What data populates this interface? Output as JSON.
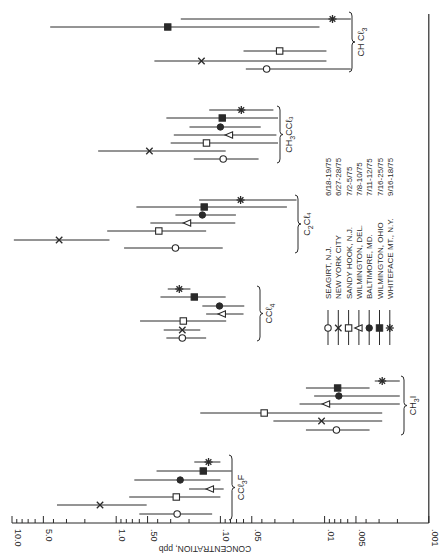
{
  "chart_data": {
    "type": "scatter",
    "orientation": "horizontal-log-x, rotated page",
    "title": "",
    "xlabel": "CONCENTRATION, ppb",
    "ylabel": "",
    "xscale": "log",
    "xlim": [
      0.001,
      10.0
    ],
    "tick_labels": [
      "10.0",
      "5.0",
      "1.0",
      ".50",
      ".10",
      ".05",
      ".01",
      ".005",
      ".001"
    ],
    "tick_values": [
      10.0,
      5.0,
      1.0,
      0.5,
      0.1,
      0.05,
      0.01,
      0.005,
      0.001
    ],
    "grid": false,
    "legend_position": "inside, center-right",
    "legend": [
      {
        "marker": "open-circle",
        "site": "SEAGIRT, N.J.",
        "dates": "6/18-19/75"
      },
      {
        "marker": "x",
        "site": "NEW YORK CITY",
        "dates": "6/27-28/75"
      },
      {
        "marker": "open-square",
        "site": "SANDY HOOK, N.J.",
        "dates": "7/2-5/75"
      },
      {
        "marker": "open-triangle-left",
        "site": "WILMINGTON, DEL.",
        "dates": "7/8-10/75"
      },
      {
        "marker": "filled-circle",
        "site": "BALTIMORE, MD.",
        "dates": "7/11-12/75"
      },
      {
        "marker": "filled-square",
        "site": "WILMINGTON, OHIO",
        "dates": "7/16-25/75"
      },
      {
        "marker": "asterisk",
        "site": "WHITEFACE MT., N.Y.",
        "dates": "9/16-18/75"
      }
    ],
    "groups": [
      {
        "compound": "CCl3F",
        "label_main": "CCℓ",
        "label_sub": "3",
        "label_tail": "F",
        "points": [
          {
            "series": "WHITEFACE MT., N.Y.",
            "marker": "asterisk",
            "value": 0.13,
            "low": 0.1,
            "high": 0.178,
            "y": 462
          },
          {
            "series": "WILMINGTON, OHIO",
            "marker": "filled-square",
            "value": 0.146,
            "low": 0.078,
            "high": 0.41,
            "y": 471
          },
          {
            "series": "BALTIMORE, MD.",
            "marker": "filled-circle",
            "value": 0.243,
            "low": 0.1,
            "high": 0.67,
            "y": 480
          },
          {
            "series": "WILMINGTON, DEL.",
            "marker": "open-triangle-left",
            "value": 0.125,
            "low": 0.093,
            "high": 0.2,
            "y": 489
          },
          {
            "series": "SANDY HOOK, N.J.",
            "marker": "open-square",
            "value": 0.265,
            "low": 0.1,
            "high": 0.75,
            "y": 497
          },
          {
            "series": "NEW YORK CITY",
            "marker": "x",
            "value": 1.43,
            "low": 0.51,
            "high": 3.7,
            "y": 505
          },
          {
            "series": "SEAGIRT, N.J.",
            "marker": "open-circle",
            "value": 0.26,
            "low": 0.12,
            "high": 0.6,
            "y": 514
          }
        ],
        "bracket": {
          "y1": 455,
          "y2": 520,
          "x": 232
        }
      },
      {
        "compound": "CH3I",
        "label_main": "CH",
        "label_sub": "3",
        "label_tail": "I",
        "points": [
          {
            "series": "WHITEFACE MT., N.Y.",
            "marker": "asterisk",
            "value": 0.0028,
            "low": 0.0019,
            "high": 0.0033,
            "y": 381
          },
          {
            "series": "WILMINGTON, OHIO",
            "marker": "filled-square",
            "value": 0.0075,
            "low": 0.0037,
            "high": 0.0151,
            "y": 388
          },
          {
            "series": "BALTIMORE, MD.",
            "marker": "filled-circle",
            "value": 0.0073,
            "low": 0.0019,
            "high": 0.0126,
            "y": 396
          },
          {
            "series": "WILMINGTON, DEL.",
            "marker": "open-triangle-left",
            "value": 0.0096,
            "low": 0.0019,
            "high": 0.0174,
            "y": 404
          },
          {
            "series": "SANDY HOOK, N.J.",
            "marker": "open-square",
            "value": 0.038,
            "low": 0.0028,
            "high": 0.156,
            "y": 413
          },
          {
            "series": "NEW YORK CITY",
            "marker": "x",
            "value": 0.0107,
            "low": 0.0028,
            "high": 0.031,
            "y": 421
          },
          {
            "series": "SEAGIRT, N.J.",
            "marker": "open-circle",
            "value": 0.0077,
            "low": 0.0037,
            "high": 0.0151,
            "y": 430
          }
        ],
        "bracket": {
          "y1": 376,
          "y2": 435,
          "x": 404
        }
      },
      {
        "compound": "CCl4",
        "label_main": "CCℓ",
        "label_sub": "4",
        "label_tail": "",
        "points": [
          {
            "series": "WHITEFACE MT., N.Y.",
            "marker": "asterisk",
            "value": 0.248,
            "low": 0.194,
            "high": 0.32,
            "y": 289
          },
          {
            "series": "WILMINGTON, OHIO",
            "marker": "filled-square",
            "value": 0.178,
            "low": 0.089,
            "high": 0.376,
            "y": 297
          },
          {
            "series": "BALTIMORE, MD.",
            "marker": "filled-circle",
            "value": 0.102,
            "low": 0.059,
            "high": 0.149,
            "y": 306
          },
          {
            "series": "WILMINGTON, DEL.",
            "marker": "open-triangle-left",
            "value": 0.096,
            "low": 0.06,
            "high": 0.137,
            "y": 314
          },
          {
            "series": "SANDY HOOK, N.J.",
            "marker": "open-square",
            "value": 0.227,
            "low": 0.088,
            "high": 0.59,
            "y": 321
          },
          {
            "series": "NEW YORK CITY",
            "marker": "x",
            "value": 0.232,
            "low": 0.156,
            "high": 0.35,
            "y": 330
          },
          {
            "series": "SEAGIRT, N.J.",
            "marker": "open-circle",
            "value": 0.232,
            "low": 0.137,
            "high": 0.33,
            "y": 338
          }
        ],
        "bracket": {
          "y1": 286,
          "y2": 341,
          "x": 260
        }
      },
      {
        "compound": "C2Cl4",
        "label_main": "C",
        "label_sub": "2",
        "label_tail": "Cℓ₄",
        "points": [
          {
            "series": "WHITEFACE MT., N.Y.",
            "marker": "asterisk",
            "value": 0.064,
            "low": 0.0186,
            "high": 0.16,
            "y": 200
          },
          {
            "series": "WILMINGTON, OHIO",
            "marker": "filled-square",
            "value": 0.143,
            "low": 0.023,
            "high": 0.64,
            "y": 207
          },
          {
            "series": "BALTIMORE, MD.",
            "marker": "filled-circle",
            "value": 0.149,
            "low": 0.071,
            "high": 0.27,
            "y": 215
          },
          {
            "series": "WILMINGTON, DEL.",
            "marker": "open-triangle-left",
            "value": 0.207,
            "low": 0.072,
            "high": 0.47,
            "y": 223
          },
          {
            "series": "SANDY HOOK, N.J.",
            "marker": "open-square",
            "value": 0.39,
            "low": 0.137,
            "high": 1.22,
            "y": 231
          },
          {
            "series": "NEW YORK CITY",
            "marker": "x",
            "value": 3.53,
            "low": 1.16,
            "high": 9.6,
            "y": 240
          },
          {
            "series": "SEAGIRT, N.J.",
            "marker": "open-circle",
            "value": 0.27,
            "low": 0.095,
            "high": 0.84,
            "y": 248
          }
        ],
        "bracket": {
          "y1": 195,
          "y2": 253,
          "x": 298
        }
      },
      {
        "compound": "CH3CCl3",
        "label_main": "CH",
        "label_sub": "3",
        "label_tail": "CCℓ₃",
        "points": [
          {
            "series": "WHITEFACE MT., N.Y.",
            "marker": "asterisk",
            "value": 0.063,
            "low": 0.031,
            "high": 0.128,
            "y": 110
          },
          {
            "series": "WILMINGTON, OHIO",
            "marker": "filled-square",
            "value": 0.096,
            "low": 0.028,
            "high": 0.33,
            "y": 118
          },
          {
            "series": "BALTIMORE, MD.",
            "marker": "filled-circle",
            "value": 0.1,
            "low": 0.041,
            "high": 0.198,
            "y": 127
          },
          {
            "series": "WILMINGTON, DEL.",
            "marker": "open-triangle-left",
            "value": 0.082,
            "low": 0.029,
            "high": 0.28,
            "y": 135
          },
          {
            "series": "SANDY HOOK, N.J.",
            "marker": "open-square",
            "value": 0.136,
            "low": 0.028,
            "high": 0.3,
            "y": 143
          },
          {
            "series": "NEW YORK CITY",
            "marker": "x",
            "value": 0.48,
            "low": 0.089,
            "high": 1.49,
            "y": 151
          },
          {
            "series": "SEAGIRT, N.J.",
            "marker": "open-circle",
            "value": 0.094,
            "low": 0.043,
            "high": 0.18,
            "y": 159
          }
        ],
        "bracket": {
          "y1": 106,
          "y2": 163,
          "x": 280
        }
      },
      {
        "compound": "CHCl3",
        "label_main": "CH Cℓ",
        "label_sub": "3",
        "label_tail": "",
        "points": [
          {
            "series": "WHITEFACE MT., N.Y.",
            "marker": "asterisk",
            "value": 0.0084,
            "low": 0.0056,
            "high": 0.24,
            "y": 19
          },
          {
            "series": "WILMINGTON, OHIO",
            "marker": "filled-square",
            "value": 0.32,
            "low": 0.0112,
            "high": 4.3,
            "y": 27
          },
          {
            "series": "SANDY HOOK, N.J.",
            "marker": "open-square",
            "value": 0.027,
            "low": 0.0096,
            "high": 0.06,
            "y": 51
          },
          {
            "series": "NEW YORK CITY",
            "marker": "x",
            "value": 0.152,
            "low": 0.0096,
            "high": 0.43,
            "y": 61
          },
          {
            "series": "SEAGIRT, N.J.",
            "marker": "open-circle",
            "value": 0.036,
            "low": 0.0056,
            "high": 0.057,
            "y": 69
          }
        ],
        "bracket": {
          "y1": 12,
          "y2": 72,
          "x": 352
        }
      }
    ]
  },
  "axis": {
    "title": "CONCENTRATION, ppb"
  },
  "legend_title": "",
  "labels": {
    "ccl3f": "CCℓ₃F",
    "ch3i": "CH₃I",
    "ccl4": "CCℓ₄",
    "c2cl4": "C₂Cℓ₄",
    "ch3ccl3": "CH₃CCℓ₃",
    "chcl3": "CH Cℓ₃"
  },
  "colors": {
    "ink": "#2a2a2a",
    "background": "#ffffff"
  }
}
